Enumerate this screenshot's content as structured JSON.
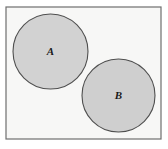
{
  "figure": {
    "universe_label": "",
    "background_color": "#ffffff"
  },
  "chart_data": {
    "type": "diagram",
    "diagram_kind": "venn",
    "title": "",
    "xlabel": "",
    "ylabel": "",
    "canvas": {
      "width": 168,
      "height": 149
    },
    "universal_set": {
      "name": "universal-set-rectangle",
      "shape": "rectangle",
      "x": 6,
      "y": 7,
      "width": 155,
      "height": 132,
      "fill": "#f7f7f6",
      "stroke": "#6e6e6e",
      "stroke_width": 1.2,
      "label": ""
    },
    "sets": [
      {
        "name": "set-a",
        "label": "A",
        "shape": "circle",
        "cx": 50.5,
        "cy": 51.5,
        "r": 37.5,
        "fill": "#d2d2d2",
        "stroke": "#4f4f4f",
        "stroke_width": 1.1,
        "label_x": 50.5,
        "label_y": 52
      },
      {
        "name": "set-b",
        "label": "B",
        "shape": "circle",
        "cx": 118.5,
        "cy": 95.5,
        "r": 36.5,
        "fill": "#cfcfcf",
        "stroke": "#4f4f4f",
        "stroke_width": 1.1,
        "label_x": 118.5,
        "label_y": 96
      }
    ],
    "relationship": "disjoint",
    "intersection": "empty",
    "legend": [],
    "annotations": []
  },
  "colors": {
    "page_background": "#ffffff",
    "rect_fill": "#f7f7f6",
    "rect_stroke": "#6e6e6e",
    "circle_fill": "#d2d2d2",
    "circle_stroke": "#4f4f4f",
    "label_color": "#1a1a1a"
  }
}
